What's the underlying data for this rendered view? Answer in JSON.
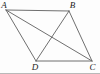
{
  "figure": {
    "type": "geometry-diagram",
    "background": "#fdfdfd",
    "line_color": "#5f5f5f",
    "label_color": "#1c1c1c",
    "vertices": {
      "A": {
        "label": "A",
        "x": 6,
        "y": 10,
        "label_x": 4,
        "label_y": 8
      },
      "B": {
        "label": "B",
        "x": 69,
        "y": 11,
        "label_x": 72.5,
        "label_y": 8
      },
      "C": {
        "label": "C",
        "x": 92,
        "y": 61,
        "label_x": 92.5,
        "label_y": 70
      },
      "D": {
        "label": "D",
        "x": 36,
        "y": 61,
        "label_x": 35,
        "label_y": 70
      }
    },
    "edges": [
      [
        "A",
        "B"
      ],
      [
        "B",
        "C"
      ],
      [
        "C",
        "D"
      ],
      [
        "D",
        "A"
      ],
      [
        "A",
        "C"
      ],
      [
        "B",
        "D"
      ]
    ]
  }
}
